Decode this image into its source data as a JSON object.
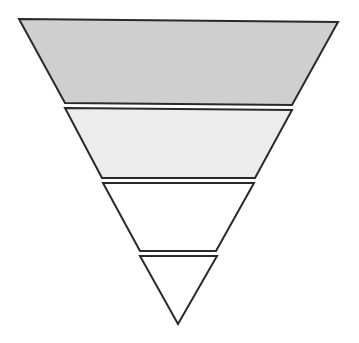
{
  "diagram": {
    "type": "inverted-pyramid",
    "tier_count": 4,
    "stroke_color": "#2a2a2a",
    "stroke_width": 2,
    "tiers": [
      {
        "id": "tier-1",
        "label": "",
        "fill": "#cfcfcf",
        "points": "19,19 338,22 292,105 65,103"
      },
      {
        "id": "tier-2",
        "label": "",
        "fill": "#ececec",
        "points": "65,108 292,110 255,178 102,178"
      },
      {
        "id": "tier-3",
        "label": "",
        "fill": "#ffffff",
        "points": "103,183 254,183 216,251 140,251"
      },
      {
        "id": "tier-4",
        "label": "",
        "fill": "#ffffff",
        "points": "140,256 217,256 178,324"
      }
    ]
  }
}
